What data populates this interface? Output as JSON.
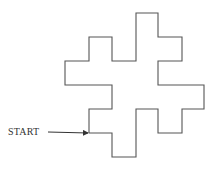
{
  "diagram": {
    "start_label": "START",
    "stroke_color": "#555555",
    "arrow": {
      "x1": 48,
      "y1": 132,
      "x2": 88,
      "y2": 133
    },
    "path_points": [
      [
        89,
        133
      ],
      [
        89,
        109
      ],
      [
        112,
        109
      ],
      [
        112,
        85
      ],
      [
        65,
        85
      ],
      [
        65,
        61
      ],
      [
        89,
        61
      ],
      [
        89,
        37
      ],
      [
        112,
        37
      ],
      [
        112,
        61
      ],
      [
        136,
        61
      ],
      [
        136,
        13
      ],
      [
        158,
        13
      ],
      [
        158,
        37
      ],
      [
        182,
        37
      ],
      [
        182,
        61
      ],
      [
        158,
        61
      ],
      [
        158,
        85
      ],
      [
        204,
        85
      ],
      [
        204,
        109
      ],
      [
        182,
        109
      ],
      [
        182,
        133
      ],
      [
        158,
        133
      ],
      [
        158,
        109
      ],
      [
        136,
        109
      ],
      [
        136,
        157
      ],
      [
        112,
        157
      ],
      [
        112,
        133
      ],
      [
        89,
        133
      ]
    ]
  }
}
